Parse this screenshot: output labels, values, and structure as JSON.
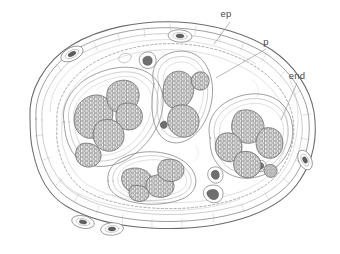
{
  "figure": {
    "kind": "botanical-cross-section-line-drawing",
    "background_color": "#ffffff",
    "ink_color": "#6b6b6b",
    "label_color": "#4a4a4a",
    "width": 340,
    "height": 254
  },
  "labels": [
    {
      "id": "ep",
      "text": "ep",
      "meaning": "epidermis",
      "x": 226,
      "y": 17,
      "leader": "M 230 22 L 214 44"
    },
    {
      "id": "p",
      "text": "p",
      "meaning": "parenchyma",
      "x": 266,
      "y": 45,
      "leader": "M 266 49 L 216 78"
    },
    {
      "id": "end",
      "text": "end",
      "meaning": "endodermis",
      "x": 294,
      "y": 79,
      "leader": "M 297 83 L 281 120"
    }
  ],
  "structures": {
    "epidermis_label": "epidermis outer boundary",
    "endodermis_label": "dashed endodermis",
    "parenchyma_label": "ground parenchyma",
    "bundle_count": 4,
    "bundles": [
      {
        "id": "bundle-left",
        "position": "left",
        "strand_count": 5
      },
      {
        "id": "bundle-top-center",
        "position": "top-center",
        "strand_count": 3
      },
      {
        "id": "bundle-right",
        "position": "right",
        "strand_count": 5
      },
      {
        "id": "bundle-bottom",
        "position": "bottom-center",
        "strand_count": 4
      }
    ],
    "resin_duct_count": 4,
    "stoma_count": 6
  }
}
